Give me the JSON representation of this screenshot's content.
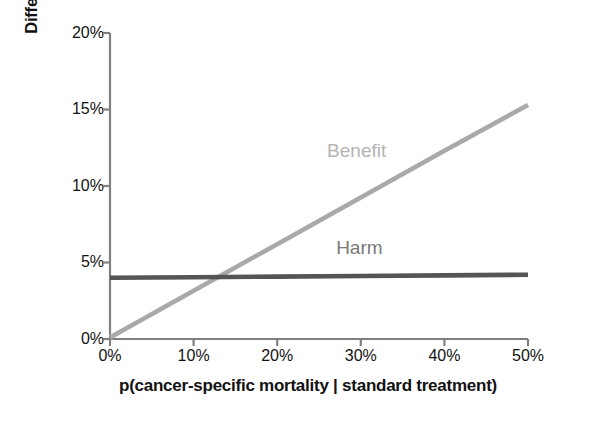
{
  "chart_data": {
    "type": "line",
    "title": "",
    "subtitle": "",
    "xlabel": "p(cancer-specific mortality | standard treatment)",
    "ylabel": "Difference in mortality",
    "xlim": [
      0,
      50
    ],
    "ylim": [
      0,
      20
    ],
    "x_unit": "%",
    "y_unit": "%",
    "grid": false,
    "legend_position": "inline-annotation",
    "x_ticks": [
      0,
      10,
      20,
      30,
      40,
      50
    ],
    "x_tick_labels": [
      "0%",
      "10%",
      "20%",
      "30%",
      "40%",
      "50%"
    ],
    "y_ticks": [
      0,
      5,
      10,
      15,
      20
    ],
    "y_tick_labels": [
      "0%",
      "5%",
      "10%",
      "15%",
      "20%"
    ],
    "series": [
      {
        "name": "Benefit",
        "color": "#a9a9a9",
        "line_width": 4,
        "x": [
          0,
          10,
          20,
          30,
          40,
          50
        ],
        "values": [
          0.1,
          3.15,
          6.2,
          9.25,
          12.3,
          15.3
        ]
      },
      {
        "name": "Harm",
        "color": "#555555",
        "line_width": 4,
        "x": [
          0,
          10,
          20,
          30,
          40,
          50
        ],
        "values": [
          4.0,
          4.04,
          4.08,
          4.12,
          4.16,
          4.2
        ]
      }
    ],
    "annotations": [
      {
        "text": "Benefit",
        "x": 29.5,
        "y": 12.3,
        "color": "#b4b4b4"
      },
      {
        "text": "Harm",
        "x": 29.8,
        "y": 5.95,
        "color": "#7a7a7a"
      }
    ],
    "crossover_point": {
      "x": 13.5,
      "y": 4.05
    }
  },
  "axes": {
    "y_title": "Difference in mortality",
    "x_title": "p(cancer-specific mortality | standard treatment)",
    "y_tick_labels": [
      "20%",
      "15%",
      "10%",
      "5%",
      "0%"
    ],
    "x_tick_labels": [
      "0%",
      "10%",
      "20%",
      "30%",
      "40%",
      "50%"
    ]
  },
  "series_labels": {
    "benefit": "Benefit",
    "harm": "Harm"
  },
  "colors": {
    "benefit_line": "#a9a9a9",
    "harm_line": "#555555",
    "axis": "#808080",
    "benefit_text": "#b4b4b4",
    "harm_text": "#7a7a7a",
    "title_text": "#121212",
    "background": "#ffffff"
  }
}
